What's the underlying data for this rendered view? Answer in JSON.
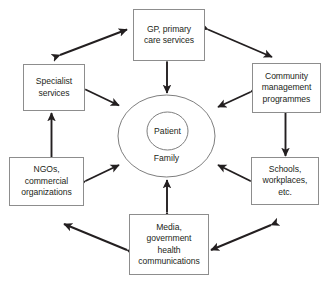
{
  "diagram": {
    "type": "hub-and-spoke network diagram",
    "core": {
      "inner_label": "Patient",
      "outer_label": "Family"
    },
    "nodes": [
      {
        "id": "gp",
        "label": "GP, primary\ncare services"
      },
      {
        "id": "community",
        "label": "Community\nmanagement\nprogrammes"
      },
      {
        "id": "schools",
        "label": "Schools,\nworkplaces,\netc."
      },
      {
        "id": "media",
        "label": "Media,\ngovernment\nhealth\ncommunications"
      },
      {
        "id": "ngos",
        "label": "NGOs,\ncommercial\norganizations"
      },
      {
        "id": "specialist",
        "label": "Specialist\nservices"
      }
    ],
    "connections": [
      {
        "from": "specialist",
        "to": "gp",
        "style": "double-arrow"
      },
      {
        "from": "gp",
        "to": "community",
        "style": "double-arrow"
      },
      {
        "from": "community",
        "to": "schools",
        "style": "double-arrow"
      },
      {
        "from": "schools",
        "to": "media",
        "style": "double-arrow"
      },
      {
        "from": "media",
        "to": "ngos",
        "style": "double-arrow"
      },
      {
        "from": "ngos",
        "to": "specialist",
        "style": "double-arrow"
      },
      {
        "from": "gp",
        "to": "core",
        "style": "double-arrow"
      },
      {
        "from": "community",
        "to": "core",
        "style": "double-arrow"
      },
      {
        "from": "schools",
        "to": "core",
        "style": "double-arrow"
      },
      {
        "from": "media",
        "to": "core",
        "style": "double-arrow"
      },
      {
        "from": "ngos",
        "to": "core",
        "style": "double-arrow"
      },
      {
        "from": "specialist",
        "to": "core",
        "style": "double-arrow"
      }
    ],
    "colors": {
      "background": "#ffffff",
      "box_border": "#8d8d8d",
      "ellipse_stroke": "#6f6f6f",
      "arrow": "#231f20",
      "text": "#231f20"
    }
  }
}
